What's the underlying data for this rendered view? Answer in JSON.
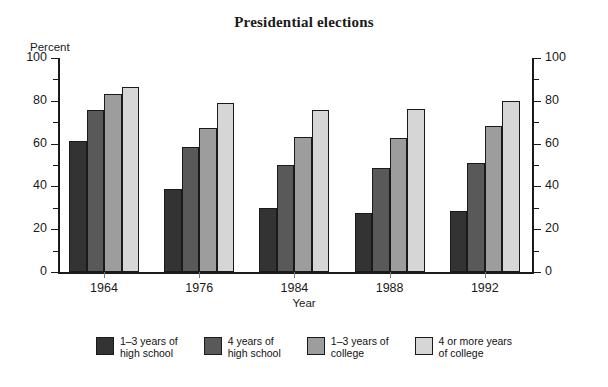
{
  "chart_data": {
    "type": "bar",
    "title": "Presidential elections",
    "xlabel": "Year",
    "ylabel": "Percent",
    "ylim": [
      0,
      100
    ],
    "ytick_labels": [
      "0",
      "20",
      "40",
      "60",
      "80",
      "100"
    ],
    "ytick_values": [
      0,
      20,
      40,
      60,
      80,
      100
    ],
    "yminor_values": [
      10,
      30,
      50,
      70,
      90
    ],
    "dual_axis": true,
    "grid": false,
    "legend_position": "bottom",
    "categories": [
      "1964",
      "1976",
      "1984",
      "1988",
      "1992"
    ],
    "series": [
      {
        "name": "1–3 years of\nhigh school",
        "color": "#333333",
        "values": [
          61,
          39,
          30,
          27.5,
          28.5
        ]
      },
      {
        "name": "4 years of\nhigh school",
        "color": "#595959",
        "values": [
          75.5,
          58.5,
          50,
          48.5,
          51
        ]
      },
      {
        "name": "1–3 years of\ncollege",
        "color": "#9d9d9d",
        "values": [
          83,
          67.5,
          63,
          62.5,
          68
        ]
      },
      {
        "name": "4 or more years\nof college",
        "color": "#d6d6d6",
        "values": [
          86.5,
          79,
          75.5,
          76,
          80
        ]
      }
    ]
  },
  "axes": {
    "left_unit_label": "Percent",
    "x_axis_title": "Year"
  },
  "colors": {
    "axis": "#1a1a1a",
    "background": "#ffffff",
    "text": "#111111"
  }
}
